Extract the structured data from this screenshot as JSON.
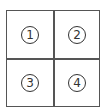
{
  "grid": {
    "rows": 2,
    "columns": 2,
    "border_color": "#555555",
    "cells": [
      {
        "label": "1"
      },
      {
        "label": "2"
      },
      {
        "label": "3"
      },
      {
        "label": "4"
      }
    ]
  }
}
